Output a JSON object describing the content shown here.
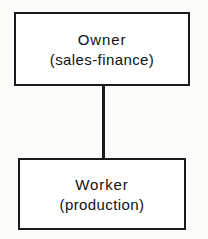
{
  "diagram": {
    "type": "organization-chart",
    "background_color": "#fbfbfa",
    "line_color": "#1a1a1a",
    "text_color": "#111111",
    "nodes": [
      {
        "id": "owner",
        "title": "Owner",
        "subtitle": "(sales-finance)"
      },
      {
        "id": "worker",
        "title": "Worker",
        "subtitle": "(production)"
      }
    ],
    "connectors": [
      {
        "id": "owner-to-worker",
        "from": "owner",
        "to": "worker",
        "style": "vertical-line"
      }
    ]
  }
}
